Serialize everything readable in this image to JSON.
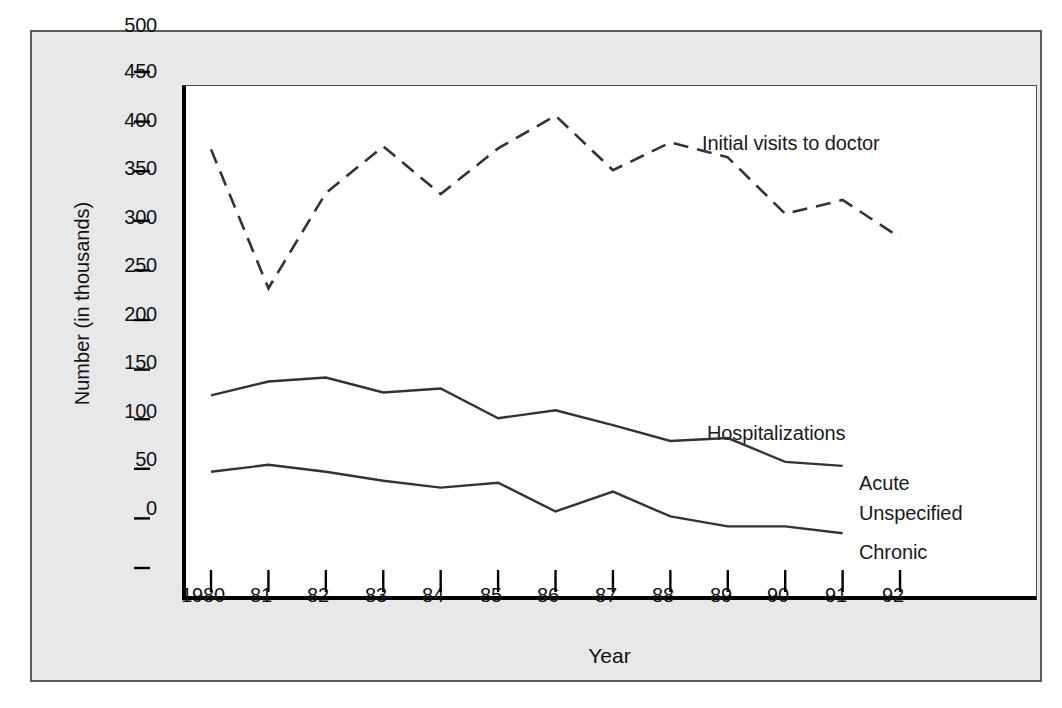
{
  "chart_data": {
    "type": "line",
    "title": "",
    "xlabel": "Year",
    "ylabel": "Number (in thousands)",
    "categories": [
      "1980",
      "81",
      "82",
      "83",
      "84",
      "85",
      "86",
      "87",
      "88",
      "89",
      "90",
      "91",
      "92"
    ],
    "x_tick_labels": [
      "1980",
      "81",
      "82",
      "83",
      "84",
      "85",
      "86",
      "87",
      "88",
      "89",
      "90",
      "91",
      "92"
    ],
    "y_tick_labels": [
      "0",
      "50",
      "100",
      "150",
      "200",
      "250",
      "300",
      "350",
      "400",
      "450",
      "500"
    ],
    "y_tick_values": [
      0,
      50,
      100,
      150,
      200,
      250,
      300,
      350,
      400,
      450,
      500
    ],
    "ylim": [
      0,
      520
    ],
    "grid": false,
    "legend_position": "inline-annotations",
    "series": [
      {
        "name": "Initial visits to doctor",
        "style": "dashed",
        "x": [
          "1980",
          "81",
          "82",
          "83",
          "84",
          "85",
          "86",
          "87",
          "88",
          "89",
          "90",
          "91",
          "92"
        ],
        "values": [
          422,
          282,
          378,
          425,
          377,
          423,
          456,
          401,
          429,
          414,
          357,
          371,
          333
        ]
      },
      {
        "name": "Acute Unspecified",
        "style": "solid",
        "x": [
          "1980",
          "81",
          "82",
          "83",
          "84",
          "85",
          "86",
          "87",
          "88",
          "89",
          "90",
          "91"
        ],
        "values": [
          174,
          188,
          192,
          177,
          181,
          151,
          159,
          144,
          128,
          131,
          107,
          103
        ]
      },
      {
        "name": "Chronic",
        "style": "solid",
        "x": [
          "1980",
          "81",
          "82",
          "83",
          "84",
          "85",
          "86",
          "87",
          "88",
          "89",
          "90",
          "91"
        ],
        "values": [
          97,
          104,
          97,
          88,
          81,
          86,
          57,
          77,
          52,
          42,
          42,
          35
        ]
      }
    ],
    "annotations": [
      {
        "text": "Initial visits to doctor",
        "x": 700,
        "y": 111
      },
      {
        "text": "Hospitalizations",
        "x": 705,
        "y": 401
      },
      {
        "text": "Acute",
        "x": 857,
        "y": 452
      },
      {
        "text": "Unspecified",
        "x": 857,
        "y": 482
      },
      {
        "text": "Chronic",
        "x": 857,
        "y": 521
      }
    ],
    "colors": {
      "line": "#333333",
      "axis": "#000000",
      "background": "#e8e8e8",
      "plot_background": "#ffffff",
      "frame": "#595959"
    }
  }
}
